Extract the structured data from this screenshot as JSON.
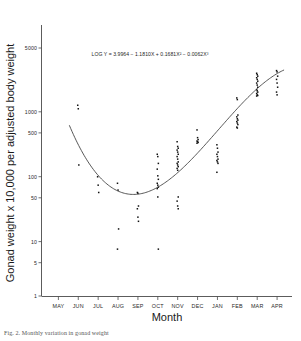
{
  "figure": {
    "caption": "Fig. 2.  Monthly variation in gonad weight"
  },
  "chart_data": {
    "type": "scatter",
    "title": "",
    "xlabel": "Month",
    "ylabel": "Gonad weight x 10,000 per adjusted body weight",
    "annotation": "LOG Y = 3.9964 − 1.1810X + 0.1681X² − 0.0062X³",
    "yscale": "log",
    "ylim": [
      1,
      9000
    ],
    "ytick_labels": [
      "5000",
      "1000",
      "500",
      "100",
      "50",
      "10",
      "5",
      "1"
    ],
    "ytick_values": [
      5000,
      1000,
      500,
      100,
      50,
      10,
      5,
      1
    ],
    "categories": [
      "MAY",
      "JUN",
      "JUL",
      "AUG",
      "SEP",
      "OCT",
      "NOV",
      "DEC",
      "JAN",
      "FEB",
      "MAR",
      "APR"
    ],
    "grid": false,
    "legend": null,
    "series": [
      {
        "name": "Observed gonad weight index",
        "marker": "square",
        "color": "#111111",
        "points": [
          {
            "x": "JUN",
            "values": [
              700,
              620,
              90
            ]
          },
          {
            "x": "JUL",
            "values": [
              60,
              45,
              35
            ]
          },
          {
            "x": "AUG",
            "values": [
              48,
              38,
              10,
              5
            ]
          },
          {
            "x": "SEP",
            "values": [
              35,
              34,
              22,
              20,
              15,
              13
            ]
          },
          {
            "x": "OCT",
            "values": [
              130,
              120,
              95,
              78,
              62,
              55,
              48,
              45,
              42,
              40,
              30,
              5
            ]
          },
          {
            "x": "NOV",
            "values": [
              200,
              170,
              160,
              150,
              140,
              130,
              120,
              110,
              100,
              95,
              90,
              85,
              80,
              75,
              30,
              26,
              22,
              20
            ]
          },
          {
            "x": "DEC",
            "values": [
              300,
              230,
              215,
              205,
              200,
              195,
              190
            ]
          },
          {
            "x": "JAN",
            "values": [
              180,
              160,
              140,
              130,
              120,
              110,
              105,
              100,
              95,
              70
            ]
          },
          {
            "x": "FEB",
            "values": [
              900,
              850,
              500,
              470,
              440,
              420,
              400,
              380,
              360,
              330,
              320
            ]
          },
          {
            "x": "MAR",
            "values": [
              2100,
              2000,
              1900,
              1800,
              1700,
              1600,
              1500,
              1400,
              1300,
              1200,
              1150,
              1100,
              1050,
              1000,
              980,
              960
            ]
          },
          {
            "x": "APR",
            "values": [
              2300,
              2200,
              1900,
              1700,
              1500,
              1300,
              1100,
              1000
            ]
          }
        ]
      }
    ],
    "fit": {
      "name": "Cubic regression fit",
      "equation": "LOG Y = 3.9964 − 1.1810X + 0.1681X² − 0.0062X³",
      "coefficients": {
        "intercept": 3.9964,
        "x": -1.181,
        "x2": 0.1681,
        "x3": -0.0062
      },
      "color": "#3a3a3a"
    }
  }
}
